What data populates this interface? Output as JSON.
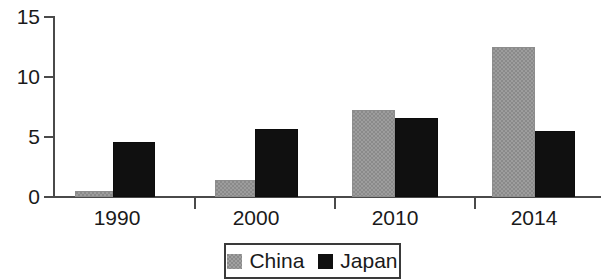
{
  "chart_data": {
    "type": "bar",
    "title": "",
    "subtitle": "",
    "xlabel": "",
    "ylabel": "",
    "categories": [
      "1990",
      "2000",
      "2010",
      "2014"
    ],
    "series": [
      {
        "name": "China",
        "color": "#8a8a8a",
        "values": [
          0.5,
          1.4,
          7.25,
          12.5
        ]
      },
      {
        "name": "Japan",
        "color": "#101010",
        "values": [
          4.6,
          5.65,
          6.6,
          5.5
        ]
      }
    ],
    "ylim": [
      0,
      15
    ],
    "yticks": [
      0,
      5,
      10,
      15
    ],
    "ytick_labels": [
      "0",
      "5",
      "10",
      "15"
    ],
    "grid": false,
    "legend_position": "bottom",
    "legend_entries": [
      "China",
      "Japan"
    ]
  },
  "axes": {
    "y_ticks": [
      {
        "label": "15",
        "value": 15
      },
      {
        "label": "10",
        "value": 10
      },
      {
        "label": "5",
        "value": 5
      },
      {
        "label": "0",
        "value": 0
      }
    ],
    "x_ticks": [
      {
        "label": "1990"
      },
      {
        "label": "2000"
      },
      {
        "label": "2010"
      },
      {
        "label": "2014"
      }
    ]
  },
  "legend": {
    "items": [
      {
        "label": "China",
        "swatch": "gray-swatch-icon"
      },
      {
        "label": "Japan",
        "swatch": "black-swatch-icon"
      }
    ]
  }
}
